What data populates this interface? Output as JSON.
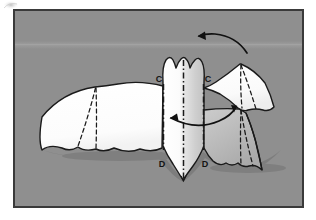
{
  "figure": {
    "name": "origami-bat-fold-step",
    "domain": "diagram",
    "caption_text": "",
    "canvas": {
      "width": 316,
      "height": 220,
      "background": "#ffffff"
    },
    "frame": {
      "name": "photo-frame",
      "x": 14,
      "y": 10,
      "width": 289,
      "height": 197,
      "fill": "#8f8f8f",
      "border_color": "#3a3a3a",
      "border_width": 2
    },
    "corner_smudge": {
      "name": "corner-smudge",
      "visible": true,
      "color": "#c9c9c9",
      "x": 3,
      "y": 1,
      "width": 16,
      "height": 9
    },
    "background_band": {
      "name": "background-light-band",
      "visible": true,
      "color": "#9b9b9b",
      "y": 43,
      "height": 5
    },
    "model": {
      "name": "paper-bat-model",
      "paper_front_color": "#ffffff",
      "paper_back_color": "#b6b6b6",
      "paper_shade_color": "#c8c8c8",
      "outline_color": "#1a1a1a",
      "outline_width": 1.4,
      "shadow_color": "#5f5f5f"
    },
    "crease_lines": {
      "name": "crease-lines",
      "style_valley": "dashed",
      "style_mountain": "dash-dot",
      "color": "#1a1a1a",
      "width": 1.3
    },
    "labels": [
      {
        "id": "label-c-left",
        "text": "C",
        "x": 160,
        "y": 81
      },
      {
        "id": "label-c-right",
        "text": "C",
        "x": 207,
        "y": 81
      },
      {
        "id": "label-d-left",
        "text": "D",
        "x": 163,
        "y": 166
      },
      {
        "id": "label-d-right",
        "text": "D",
        "x": 204,
        "y": 166
      }
    ],
    "arrows": [
      {
        "id": "arrow-fold-top",
        "name": "fold-arrow-top",
        "type": "curved-single-head",
        "direction": "right-to-left",
        "head_at": "start",
        "color": "#111111",
        "width": 1.6
      },
      {
        "id": "arrow-fold-middle",
        "name": "fold-arrow-middle",
        "type": "curved-double-head",
        "direction": "bidirectional",
        "head_at": "both",
        "color": "#111111",
        "width": 1.6
      }
    ]
  }
}
